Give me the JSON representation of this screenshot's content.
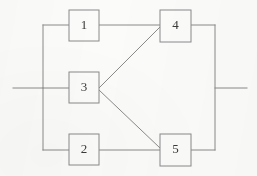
{
  "figure": {
    "type": "reliability-block-diagram",
    "title": "",
    "background_color": "#fbfbfa",
    "line_color": "#8a8a8a",
    "box_stroke_color": "#8a8a8a",
    "box_fill_color": "#fbfbfa",
    "label_color": "#3a3a3a",
    "line_width": 1
  },
  "blocks": [
    {
      "id": "block-1",
      "label": "1",
      "x": 69,
      "y": 10,
      "width": 30,
      "height": 31
    },
    {
      "id": "block-3",
      "label": "3",
      "x": 69,
      "y": 72,
      "width": 30,
      "height": 31
    },
    {
      "id": "block-2",
      "label": "2",
      "x": 69,
      "y": 134,
      "width": 30,
      "height": 31
    },
    {
      "id": "block-4",
      "label": "4",
      "x": 160,
      "y": 10,
      "width": 31,
      "height": 32
    },
    {
      "id": "block-5",
      "label": "5",
      "x": 160,
      "y": 134,
      "width": 31,
      "height": 32
    }
  ],
  "connections": [
    {
      "id": "input-lead",
      "points": "13,88 43,88"
    },
    {
      "id": "left-bus-vertical",
      "points": "43,25 43,150"
    },
    {
      "id": "left-bus-to-1",
      "points": "43,25 69,25"
    },
    {
      "id": "left-bus-to-3",
      "points": "43,88 69,88"
    },
    {
      "id": "left-bus-to-2",
      "points": "43,150 69,150"
    },
    {
      "id": "block-1-to-4",
      "points": "99,25 160,25"
    },
    {
      "id": "block-2-to-5",
      "points": "99,150 160,150"
    },
    {
      "id": "block-3-to-4",
      "points": "99,88 160,27"
    },
    {
      "id": "block-3-to-5",
      "points": "99,90 160,148"
    },
    {
      "id": "block-4-to-right-bus",
      "points": "191,25 215,25"
    },
    {
      "id": "block-5-to-right-bus",
      "points": "191,150 215,150"
    },
    {
      "id": "right-bus-vertical",
      "points": "215,25 215,150"
    },
    {
      "id": "output-lead",
      "points": "215,88 247,88"
    }
  ],
  "terminals": {
    "input_label": "",
    "output_label": ""
  }
}
